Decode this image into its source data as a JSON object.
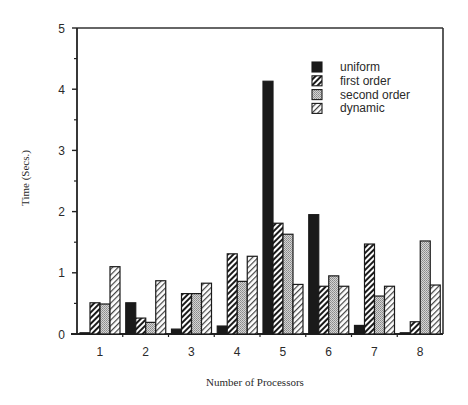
{
  "chart_data": {
    "type": "bar",
    "title": "",
    "xlabel": "Number of Processors",
    "ylabel": "Time (Secs.)",
    "ylim": [
      0,
      5
    ],
    "yticks": [
      0,
      1,
      2,
      3,
      4,
      5
    ],
    "yminor_step": 0.5,
    "grid": false,
    "legend_position": "top-right",
    "categories": [
      "1",
      "2",
      "3",
      "4",
      "5",
      "6",
      "7",
      "8"
    ],
    "series": [
      {
        "name": "uniform",
        "pattern": "solid-black",
        "values": [
          0.02,
          0.51,
          0.08,
          0.13,
          4.13,
          1.95,
          0.14,
          0.02
        ]
      },
      {
        "name": "first order",
        "pattern": "dense-hatch",
        "values": [
          0.51,
          0.26,
          0.66,
          1.31,
          1.81,
          0.78,
          1.47,
          0.2
        ]
      },
      {
        "name": "second order",
        "pattern": "stipple-gray",
        "values": [
          0.49,
          0.19,
          0.66,
          0.86,
          1.63,
          0.95,
          0.62,
          1.52
        ]
      },
      {
        "name": "dynamic",
        "pattern": "light-hatch",
        "values": [
          1.1,
          0.87,
          0.83,
          1.27,
          0.81,
          0.78,
          0.78,
          0.8
        ]
      }
    ]
  },
  "colors": {
    "ink": "#1a1a1a",
    "stipple_bg": "#c8c8c8",
    "background": "#ffffff"
  }
}
